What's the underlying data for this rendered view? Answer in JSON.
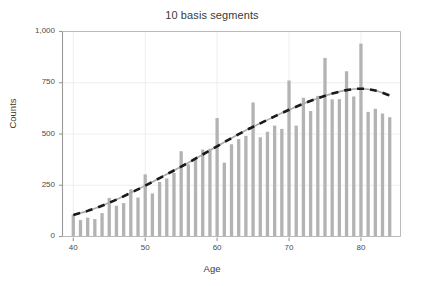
{
  "chart_data": {
    "type": "bar",
    "title": "10 basis segments",
    "xlabel": "Age",
    "ylabel": "Counts",
    "xlim": [
      38.5,
      85.5
    ],
    "ylim": [
      0,
      1000
    ],
    "grid": true,
    "legend": "none",
    "categories": [
      40,
      41,
      42,
      43,
      44,
      45,
      46,
      47,
      48,
      49,
      50,
      51,
      52,
      53,
      54,
      55,
      56,
      57,
      58,
      59,
      60,
      61,
      62,
      63,
      64,
      65,
      66,
      67,
      68,
      69,
      70,
      71,
      72,
      73,
      74,
      75,
      76,
      77,
      78,
      79,
      80,
      81,
      82,
      83,
      84
    ],
    "values": [
      107,
      80,
      92,
      85,
      114,
      188,
      150,
      163,
      230,
      190,
      303,
      210,
      266,
      283,
      310,
      416,
      352,
      382,
      424,
      428,
      578,
      360,
      450,
      475,
      491,
      654,
      484,
      511,
      541,
      525,
      761,
      541,
      677,
      612,
      686,
      871,
      669,
      670,
      806,
      683,
      941,
      608,
      623,
      600,
      582
    ],
    "xticks": [
      40,
      50,
      60,
      70,
      80
    ],
    "xtick_labels": [
      "40",
      "50",
      "60",
      "70",
      "80"
    ],
    "yticks": [
      0,
      250,
      500,
      750,
      1000
    ],
    "ytick_labels": [
      "0",
      "250",
      "500",
      "750",
      "1,000"
    ],
    "series": [
      {
        "name": "counts",
        "kind": "bar",
        "color": "#b3b3b3",
        "values": [
          107,
          80,
          92,
          85,
          114,
          188,
          150,
          163,
          230,
          190,
          303,
          210,
          266,
          283,
          310,
          416,
          352,
          382,
          424,
          428,
          578,
          360,
          450,
          475,
          491,
          654,
          484,
          511,
          541,
          525,
          761,
          541,
          677,
          612,
          686,
          871,
          669,
          670,
          806,
          683,
          941,
          608,
          623,
          600,
          582
        ]
      },
      {
        "name": "spline-fit",
        "kind": "line",
        "color": "#a8a8a8",
        "overlay_color": "#1a1a1a",
        "overlay_style": "dashed",
        "x": [
          40,
          42,
          44,
          46,
          48,
          50,
          52,
          54,
          56,
          58,
          60,
          62,
          64,
          66,
          68,
          70,
          72,
          74,
          76,
          78,
          80,
          82,
          84
        ],
        "values": [
          105,
          125,
          150,
          180,
          213,
          248,
          285,
          322,
          360,
          400,
          440,
          480,
          518,
          552,
          586,
          618,
          648,
          674,
          697,
          714,
          721,
          712,
          688
        ]
      }
    ],
    "colors": {
      "bar": "#b3b3b3",
      "fit_line": "#a8a8a8",
      "fit_dash": "#1a1a1a",
      "axis": "#999999",
      "grid": "#eeeeee",
      "text": "#3a3a3a",
      "background": "#ffffff"
    }
  },
  "figure": {
    "title": "10 basis segments",
    "axis_x_label": "Age",
    "axis_y_label": "Counts"
  }
}
